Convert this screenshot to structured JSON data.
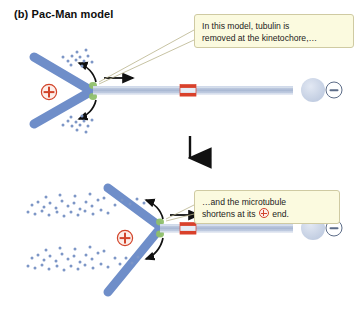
{
  "panel": {
    "label": "(b) Pac-Man model"
  },
  "callouts": [
    {
      "id": "callout-1",
      "text": "In this model, tubulin is\nremoved at the kinetochore,…"
    },
    {
      "id": "callout-2",
      "text_before": "…and the microtubule\nshortens at its ",
      "symbol": "plus-circle",
      "text_after": " end."
    }
  ],
  "diagrams": [
    {
      "name": "upper-stage",
      "description": "Chromosome with kinetochore attached to a long microtubule",
      "microtubule_length_px": 200,
      "marks": {
        "plus_end_label": "+",
        "minus_end_label": "–",
        "photobleach_band_color": "#d9412b",
        "microtubule_color": "#b9c6dd",
        "chromosome_color": "#6f8ec9",
        "kinetochore_color": "#8fc06a",
        "spindle_pole_color": "#c6d1e4"
      }
    },
    {
      "name": "lower-stage",
      "description": "Chromosome has moved poleward; microtubule is shorter and many free tubulin dimers released",
      "microtubule_length_px": 130,
      "marks": {
        "plus_end_label": "+",
        "minus_end_label": "–",
        "photobleach_band_color": "#d9412b",
        "microtubule_color": "#b9c6dd",
        "chromosome_color": "#6f8ec9",
        "kinetochore_color": "#8fc06a",
        "spindle_pole_color": "#c6d1e4"
      }
    }
  ],
  "transition": {
    "arrow": "down-arrow"
  },
  "colors": {
    "callout_fill": "#fbfadf",
    "callout_border": "#cfcaa2",
    "plus_marker": "#d2442a",
    "minus_marker": "#4a5a78",
    "tubulin_dimer": "#7d96c6",
    "background": "#ffffff",
    "text": "#0e0e0e"
  }
}
